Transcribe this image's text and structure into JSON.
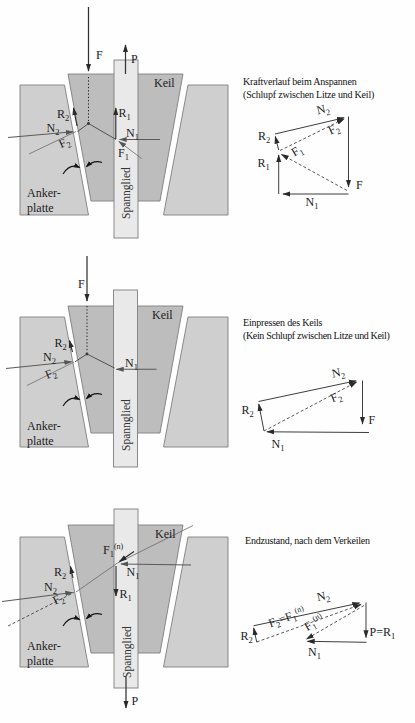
{
  "figure": {
    "colors": {
      "plate": "#cfcfcf",
      "wedge": "#bdbdbd",
      "tendon": "#e9e9e9",
      "line": "#333333"
    },
    "sections": [
      {
        "caption": [
          "Kraftverlauf beim Anspannen",
          "(Schlupf zwischen Litze und Keil)"
        ],
        "mech": {
          "F": "F",
          "P": "P",
          "R1": "R_1",
          "R2": "R_2",
          "N1": "N_1",
          "N2": "N_2",
          "F1": "F_1",
          "F2": "F_2",
          "keil": "Keil",
          "anker1": "Anker-",
          "anker2": "platte",
          "spannglied": "Spannglied"
        },
        "poly": {
          "R1": "R_1",
          "R2": "R_2",
          "N1": "N_1",
          "N2": "N_2",
          "F1": "F_1",
          "F2": "F_2",
          "F": "F"
        }
      },
      {
        "caption": [
          "Einpressen des Keils",
          "(Kein Schlupf zwischen Litze und Keil)"
        ],
        "mech": {
          "F": "F",
          "R2": "R_2",
          "N1": "N_1",
          "N2": "N_2",
          "F2": "F_2",
          "keil": "Keil",
          "anker1": "Anker-",
          "anker2": "platte",
          "spannglied": "Spannglied"
        },
        "poly": {
          "R2": "R_2",
          "N1": "N_1",
          "N2": "N_2",
          "F2": "F_2",
          "F": "F"
        }
      },
      {
        "caption": [
          "Endzustand, nach dem Verkeilen"
        ],
        "mech": {
          "P": "P",
          "R1": "R_1",
          "R2": "R_2",
          "N1": "N_1",
          "N2": "N_2",
          "F1n": "F_1^(n)",
          "F2": "F_2",
          "keil": "Keil",
          "anker1": "Anker-",
          "anker2": "platte",
          "spannglied": "Spannglied"
        },
        "poly": {
          "R2": "R_2",
          "N1": "N_1",
          "N2": "N_2",
          "F2F1n": "F_2=F_1^(n)",
          "F1n": "F_1^(n)",
          "PR1": "P=R_1"
        }
      }
    ]
  }
}
